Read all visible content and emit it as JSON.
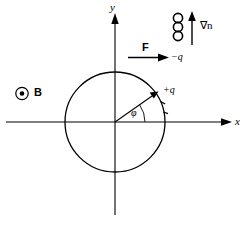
{
  "figure": {
    "type": "physics-diagram",
    "background_color": "#ffffff",
    "stroke_color": "#000000",
    "width": 244,
    "height": 238
  },
  "axes": {
    "x_label": "x",
    "y_label": "y",
    "origin": {
      "x": 115,
      "y": 122
    },
    "x_axis": {
      "start_x": 6,
      "end_x": 232,
      "y": 122,
      "arrow": "right"
    },
    "y_axis": {
      "x": 115,
      "start_y": 215,
      "end_y": 13,
      "arrow": "up"
    }
  },
  "orbit": {
    "name": "gyro-orbit-circle",
    "center": {
      "x": 115,
      "y": 122
    },
    "radius": 50,
    "filled": false
  },
  "angle": {
    "symbol": "φ",
    "label": "φ",
    "arc_radius": 30,
    "value_degrees": 35
  },
  "radius_vector": {
    "name": "radius-to-positive-charge",
    "from": {
      "x": 115,
      "y": 122
    },
    "to": {
      "x": 156,
      "y": 93
    },
    "arrow": "outward"
  },
  "labels": {
    "positive_charge": "+q",
    "negative_charge": "−q",
    "force": "F",
    "magnetic_field": "B",
    "density_gradient": "∇n"
  },
  "magnetic_field_marker": {
    "name": "b-field-out-of-page",
    "symbol": "⊙",
    "label": "B",
    "position": {
      "x": 22,
      "y": 93
    },
    "meaning": "field out of page"
  },
  "force_arrow": {
    "name": "force-arrow",
    "label": "F",
    "direction": "right",
    "start": {
      "x": 128,
      "y": 57
    },
    "end": {
      "x": 168,
      "y": 57
    }
  },
  "gradient_arrow": {
    "name": "density-gradient-arrow",
    "label": "∇n",
    "direction": "up",
    "x": 192,
    "start_y": 44,
    "end_y": 12
  },
  "gradient_circles": {
    "name": "stacked-density-circles",
    "count": 3,
    "x": 178,
    "radius": 4.6,
    "centers_y": [
      18,
      27,
      36
    ]
  },
  "orbit_tick_marks": {
    "name": "orbit-direction-ticks",
    "count": 2,
    "description": "short ticks on circle indicating motion direction"
  }
}
